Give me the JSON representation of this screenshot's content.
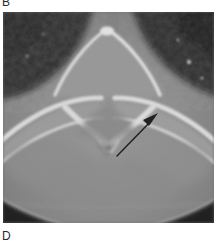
{
  "figure": {
    "type": "medical-ct-scan",
    "modality": "CT",
    "plane": "axial",
    "region": "spine",
    "labels": {
      "top_panel_letter": "B",
      "bottom_panel_letter": "D"
    },
    "annotation": {
      "kind": "arrow",
      "color": "#0d0d0d",
      "direction": "up-right",
      "tail": {
        "x": 117,
        "y": 156
      },
      "tip": {
        "x": 158,
        "y": 114
      }
    },
    "image": {
      "frame": {
        "x": 3,
        "y": 12,
        "width": 211,
        "height": 211
      },
      "background_gray": "#8d8d8d",
      "air_gray": "#0e0e0e",
      "soft_tissue_gray": "#8a8a8a",
      "bone_bright": "#ececec",
      "marrow_gray": "#9d9d9d"
    }
  }
}
